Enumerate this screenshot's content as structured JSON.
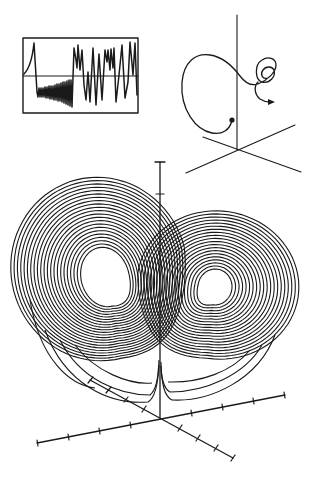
{
  "figure": {
    "colors": {
      "ink": "#1a1a1a",
      "background": "#ffffff"
    },
    "panels": [
      {
        "id": "time-series-inset",
        "description": "Boxed time series of one coordinate showing growing oscillations then chaotic switching"
      },
      {
        "id": "single-trajectory",
        "description": "Single trajectory in 3D axes with start dot, large loop and spiral ending with arrow"
      },
      {
        "id": "attractor-main",
        "description": "Butterfly-shaped two-lobed strange attractor above 3D tick-marked axes"
      }
    ]
  }
}
